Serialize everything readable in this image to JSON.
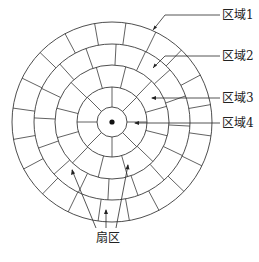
{
  "diagram": {
    "labels": {
      "zone1": "区域1",
      "zone2": "区域2",
      "zone3": "区域3",
      "zone4": "区域4",
      "sector": "扇区"
    },
    "center": {
      "x": 112,
      "y": 122
    },
    "rings": [
      15,
      35,
      57,
      78,
      100
    ],
    "zones": [
      {
        "name": "区域1",
        "inner": 78,
        "outer": 100,
        "sectors": 20
      },
      {
        "name": "区域2",
        "inner": 57,
        "outer": 78,
        "sectors": 16
      },
      {
        "name": "区域3",
        "inner": 35,
        "outer": 57,
        "sectors": 12
      },
      {
        "name": "区域4",
        "inner": 15,
        "outer": 35,
        "sectors": 8
      }
    ],
    "colors": {
      "line": "#3a3a3a",
      "background": "#ffffff",
      "text": "#222222"
    }
  }
}
